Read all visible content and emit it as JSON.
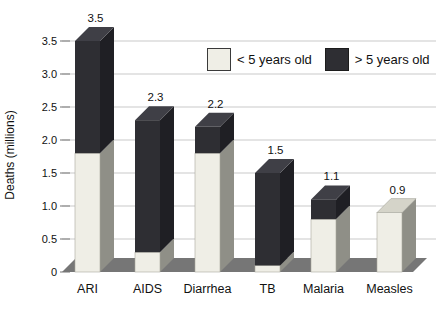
{
  "chart_data": {
    "type": "bar",
    "subtype": "stacked-3d-column",
    "title": "",
    "ylabel": "Deaths (millions)",
    "xlabel": "",
    "categories": [
      "ARI",
      "AIDS",
      "Diarrhea",
      "TB",
      "Malaria",
      "Measles"
    ],
    "series": [
      {
        "name": "< 5 years old",
        "color": "#efeee6",
        "values": [
          1.8,
          0.3,
          1.8,
          0.1,
          0.8,
          0.9
        ]
      },
      {
        "name": "> 5 years old",
        "color": "#2e2e33",
        "values": [
          1.7,
          2.0,
          0.4,
          1.4,
          0.3,
          0
        ]
      }
    ],
    "totals": [
      3.5,
      2.3,
      2.2,
      1.5,
      1.1,
      0.9
    ],
    "total_labels": [
      "3.5",
      "2.3",
      "2.2",
      "1.5",
      "1.1",
      "0.9"
    ],
    "y_ticks": [
      {
        "value": 0,
        "label": "0"
      },
      {
        "value": 0.5,
        "label": "0.5"
      },
      {
        "value": 1.0,
        "label": "1.0"
      },
      {
        "value": 1.5,
        "label": "1.5"
      },
      {
        "value": 2.0,
        "label": "2.0"
      },
      {
        "value": 2.5,
        "label": "2.5"
      },
      {
        "value": 3.0,
        "label": "3.0"
      },
      {
        "value": 3.5,
        "label": "3.5"
      }
    ],
    "ylim": [
      0,
      3.5
    ],
    "grid": true,
    "legend_position": "top-right",
    "colors": {
      "light_front": "#efeee6",
      "light_side": "#8f8f87",
      "light_top": "#d5d4c9",
      "dark_front": "#2e2e33",
      "dark_side": "#1f1f24",
      "dark_top": "#3f3f46",
      "floor": "#767676",
      "gridline": "#c9c9c9",
      "tick": "#8a8a8a",
      "text": "#111111"
    }
  }
}
